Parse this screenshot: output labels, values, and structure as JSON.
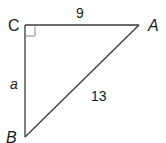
{
  "figure": {
    "type": "right-triangle",
    "vertices": {
      "C": {
        "label": "C",
        "x": 25,
        "y": 25,
        "right_angle": true
      },
      "A": {
        "label": "A",
        "x": 139,
        "y": 25
      },
      "B": {
        "label": "B",
        "x": 25,
        "y": 137
      }
    },
    "sides": {
      "CA": {
        "label": "9",
        "from": "C",
        "to": "A"
      },
      "CB": {
        "label": "a",
        "from": "C",
        "to": "B"
      },
      "AB": {
        "label": "13",
        "from": "A",
        "to": "B",
        "hypotenuse": true
      }
    },
    "colors": {
      "edge": "#3a3a3a",
      "right_angle_marker": "#8a8a8a",
      "text": "#1a1a1a",
      "background": "#ffffff"
    }
  }
}
